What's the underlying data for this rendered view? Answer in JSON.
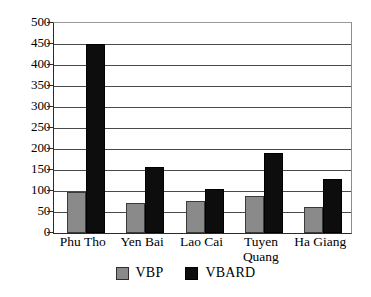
{
  "chart_data": {
    "type": "bar",
    "title": "",
    "subtitle": "",
    "xlabel": "",
    "ylabel": "",
    "categories": [
      "Phu Tho",
      "Yen Bai",
      "Lao Cai",
      "Tuyen\nQuang",
      "Ha Giang"
    ],
    "series": [
      {
        "name": "VBP",
        "color": "#8a8a8a",
        "values": [
          97,
          72,
          77,
          89,
          63
        ]
      },
      {
        "name": "VBARD",
        "color": "#0d0d0d",
        "values": [
          450,
          158,
          105,
          191,
          128
        ]
      }
    ],
    "ylim": [
      0,
      500
    ],
    "ytick_step": 50,
    "yticks": [
      0,
      50,
      100,
      150,
      200,
      250,
      300,
      350,
      400,
      450,
      500
    ],
    "ytick_labels": [
      "0",
      "50",
      "100",
      "150",
      "200",
      "250",
      "300",
      "350",
      "400",
      "450",
      "500"
    ],
    "grid": true,
    "grid_axis": "y",
    "legend_position": "bottom",
    "bar_mode": "grouped"
  },
  "legend": {
    "entries": [
      {
        "label": "VBP",
        "swatch": "gray-swatch-icon"
      },
      {
        "label": "VBARD",
        "swatch": "black-swatch-icon"
      }
    ]
  }
}
